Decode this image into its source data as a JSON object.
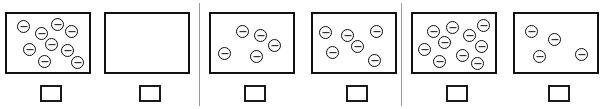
{
  "diagram": {
    "symbol_name": "negative-charge-icon",
    "symbol_glyph": "⊖",
    "line_color": "#111111",
    "background_color": "#ffffff",
    "divider_color": "#9a9a9a",
    "panel_count": 3,
    "panels": [
      {
        "id": "panel-1",
        "x": 0,
        "divider_after": true,
        "cells": [
          {
            "id": "cell-1",
            "box_x": 5,
            "answer_box_x": 40,
            "answer_value": "",
            "charge_count": 9,
            "charges": [
              {
                "x": 10,
                "y": 6
              },
              {
                "x": 28,
                "y": 13
              },
              {
                "x": 44,
                "y": 4
              },
              {
                "x": 58,
                "y": 11
              },
              {
                "x": 16,
                "y": 29
              },
              {
                "x": 38,
                "y": 24
              },
              {
                "x": 54,
                "y": 30
              },
              {
                "x": 31,
                "y": 41
              },
              {
                "x": 64,
                "y": 42
              }
            ]
          },
          {
            "id": "cell-2",
            "box_x": 104,
            "answer_box_x": 139,
            "answer_value": "",
            "charge_count": 0,
            "charges": []
          }
        ]
      },
      {
        "id": "panel-2",
        "x": 201,
        "divider_after": true,
        "cells": [
          {
            "id": "cell-3",
            "box_x": 209,
            "answer_box_x": 244,
            "answer_value": "",
            "charge_count": 5,
            "charges": [
              {
                "x": 25,
                "y": 11
              },
              {
                "x": 43,
                "y": 15
              },
              {
                "x": 57,
                "y": 25
              },
              {
                "x": 7,
                "y": 33
              },
              {
                "x": 39,
                "y": 36
              }
            ]
          },
          {
            "id": "cell-4",
            "box_x": 311,
            "answer_box_x": 346,
            "answer_value": "",
            "charge_count": 6,
            "charges": [
              {
                "x": 6,
                "y": 12
              },
              {
                "x": 28,
                "y": 15
              },
              {
                "x": 57,
                "y": 11
              },
              {
                "x": 38,
                "y": 26
              },
              {
                "x": 13,
                "y": 32
              },
              {
                "x": 55,
                "y": 40
              }
            ]
          }
        ]
      },
      {
        "id": "panel-3",
        "x": 403,
        "divider_after": false,
        "cells": [
          {
            "id": "cell-5",
            "box_x": 411,
            "answer_box_x": 446,
            "answer_value": "",
            "charge_count": 10,
            "charges": [
              {
                "x": 14,
                "y": 11
              },
              {
                "x": 33,
                "y": 7
              },
              {
                "x": 50,
                "y": 15
              },
              {
                "x": 64,
                "y": 5
              },
              {
                "x": 25,
                "y": 22
              },
              {
                "x": 5,
                "y": 29
              },
              {
                "x": 62,
                "y": 26
              },
              {
                "x": 43,
                "y": 35
              },
              {
                "x": 20,
                "y": 41
              },
              {
                "x": 58,
                "y": 43
              }
            ]
          },
          {
            "id": "cell-6",
            "box_x": 513,
            "answer_box_x": 548,
            "answer_value": "",
            "charge_count": 4,
            "charges": [
              {
                "x": 10,
                "y": 11
              },
              {
                "x": 33,
                "y": 19
              },
              {
                "x": 18,
                "y": 36
              },
              {
                "x": 60,
                "y": 34
              }
            ]
          }
        ]
      }
    ]
  }
}
